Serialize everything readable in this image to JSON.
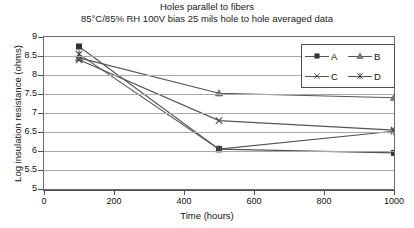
{
  "chart_data": {
    "type": "line",
    "title": "Holes parallel to fibers",
    "subtitle": "85°C/85% RH 100V bias 25 mils hole to hole averaged data",
    "xlabel": "Time (hours)",
    "ylabel": "Log insulation resistance (ohms)",
    "xlim": [
      0,
      1000
    ],
    "ylim": [
      5,
      9
    ],
    "xticks": [
      0,
      200,
      400,
      600,
      800,
      1000
    ],
    "yticks": [
      5,
      5.5,
      6,
      6.5,
      7,
      7.5,
      8,
      8.5,
      9
    ],
    "grid": true,
    "legend_position": "top-right",
    "x": [
      100,
      500,
      1000
    ],
    "series": [
      {
        "name": "A",
        "marker": "square",
        "values": [
          8.75,
          6.05,
          5.95
        ]
      },
      {
        "name": "B",
        "marker": "triangle",
        "values": [
          8.45,
          7.52,
          7.4
        ]
      },
      {
        "name": "C",
        "marker": "cross",
        "values": [
          8.4,
          6.8,
          6.55
        ]
      },
      {
        "name": "D",
        "marker": "star",
        "values": [
          8.55,
          6.05,
          6.52
        ]
      }
    ]
  },
  "legend": {
    "entries": [
      {
        "label": "A"
      },
      {
        "label": "B"
      },
      {
        "label": "C"
      },
      {
        "label": "D"
      }
    ]
  },
  "colors": {
    "axis": "#4d4d4d",
    "grid": "#a8a8a8",
    "series": "#555555",
    "background": "#ffffff"
  }
}
